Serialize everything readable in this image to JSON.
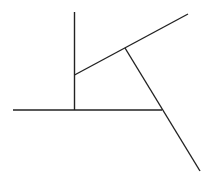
{
  "diagram": {
    "width": 209,
    "height": 180,
    "background": "#ffffff",
    "stroke_color": "#222222",
    "stroke_width": 1.4,
    "segments": [
      {
        "name": "vertical-line",
        "x1": 74.5,
        "y1": 12,
        "x2": 74.5,
        "y2": 110
      },
      {
        "name": "horizontal-line",
        "x1": 13,
        "y1": 110,
        "x2": 162,
        "y2": 110
      },
      {
        "name": "upper-slanted-line",
        "x1": 74.5,
        "y1": 75,
        "x2": 188,
        "y2": 14
      },
      {
        "name": "lower-slanted-line",
        "x1": 125,
        "y1": 48,
        "x2": 200,
        "y2": 171
      }
    ]
  }
}
